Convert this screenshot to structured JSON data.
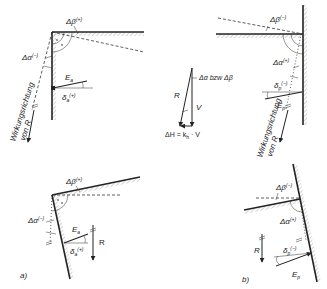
{
  "diagram": {
    "panels": [
      {
        "id": "a_top",
        "labels": {
          "delta_beta": "Δβ",
          "delta_beta_sign": "(+)",
          "delta_alpha": "Δα",
          "delta_alpha_sign": "(−)",
          "force": "E",
          "force_sub": "a",
          "delta": "δ",
          "delta_sub": "a",
          "delta_sign": "(+)",
          "direction_line1": "Wirkungsrichtung",
          "direction_line2": "von R"
        }
      },
      {
        "id": "b_top",
        "labels": {
          "delta_beta": "Δβ",
          "delta_beta_sign": "(−)",
          "delta_alpha": "Δα",
          "delta_alpha_sign": "(+)",
          "force": "E",
          "force_sub": "p",
          "delta": "δ",
          "delta_sub": "p",
          "delta_sign": "(−)",
          "direction_line1": "Wirkungsrichtung",
          "direction_line2": "von R"
        }
      },
      {
        "id": "force_triangle",
        "labels": {
          "R": "R",
          "V": "V",
          "angle": "Δα bzw Δβ",
          "equation": "ΔH = kh · V"
        }
      },
      {
        "id": "a_bottom",
        "tag": "a)",
        "labels": {
          "delta_beta": "Δβ",
          "delta_beta_sign": "(+)",
          "delta_alpha": "Δα",
          "delta_alpha_sign": "(−)",
          "force": "E",
          "force_sub": "a",
          "delta": "δ",
          "delta_sub": "a",
          "delta_sign": "(+)",
          "R": "R"
        }
      },
      {
        "id": "b_bottom",
        "tag": "b)",
        "labels": {
          "delta_beta": "Δβ",
          "delta_beta_sign": "(−)",
          "delta_alpha": "Δα",
          "delta_alpha_sign": "(+)",
          "force": "E",
          "force_sub": "p",
          "delta": "δ",
          "delta_sub": "p",
          "delta_sign": "(−)",
          "R": "R"
        }
      }
    ],
    "equation_parts": {
      "lhs": "ΔH = k",
      "sub": "h",
      "rhs": " · V"
    }
  }
}
